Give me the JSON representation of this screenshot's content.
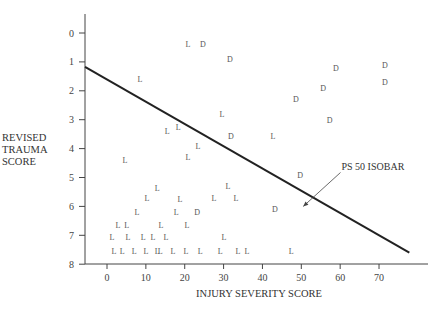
{
  "chart_data": {
    "type": "scatter",
    "title": "",
    "xlabel": "INJURY SEVERITY SCORE",
    "ylabel_lines": [
      "REVISED",
      "TRAUMA",
      "SCORE"
    ],
    "xlim": [
      -6,
      78
    ],
    "ylim": [
      -0.8,
      8
    ],
    "y_inverted": true,
    "grid": false,
    "x_ticks": [
      0,
      10,
      20,
      30,
      40,
      50,
      60,
      70
    ],
    "y_ticks": [
      0,
      1,
      2,
      3,
      4,
      5,
      6,
      7,
      8
    ],
    "legend": {
      "L": "Lived",
      "D": "Died"
    },
    "series": [
      {
        "name": "L",
        "marker_text": "L",
        "points": [
          [
            20.8,
            0.38
          ],
          [
            8.5,
            1.6
          ],
          [
            29.6,
            2.8
          ],
          [
            18.3,
            3.25
          ],
          [
            15.5,
            3.4
          ],
          [
            42.7,
            3.55
          ],
          [
            23.4,
            3.9
          ],
          [
            20.8,
            4.3
          ],
          [
            4.6,
            4.4
          ],
          [
            31.1,
            5.3
          ],
          [
            12.9,
            5.36
          ],
          [
            33.2,
            5.7
          ],
          [
            27.5,
            5.7
          ],
          [
            10.3,
            5.7
          ],
          [
            18.8,
            5.75
          ],
          [
            7.7,
            6.2
          ],
          [
            17.8,
            6.2
          ],
          [
            2.8,
            6.64
          ],
          [
            5.1,
            6.64
          ],
          [
            13.9,
            6.64
          ],
          [
            20.6,
            6.64
          ],
          [
            1.3,
            7.05
          ],
          [
            5.4,
            7.05
          ],
          [
            9.3,
            7.05
          ],
          [
            11.8,
            7.05
          ],
          [
            15.2,
            7.05
          ],
          [
            30.1,
            7.05
          ],
          [
            1.8,
            7.55
          ],
          [
            3.9,
            7.55
          ],
          [
            7.0,
            7.55
          ],
          [
            10.0,
            7.55
          ],
          [
            12.9,
            7.55
          ],
          [
            13.7,
            7.55
          ],
          [
            17.0,
            7.55
          ],
          [
            20.3,
            7.55
          ],
          [
            24.0,
            7.55
          ],
          [
            29.1,
            7.55
          ],
          [
            33.7,
            7.55
          ],
          [
            36.0,
            7.55
          ],
          [
            47.4,
            7.55
          ]
        ]
      },
      {
        "name": "D",
        "marker_text": "D",
        "points": [
          [
            24.7,
            0.38
          ],
          [
            31.6,
            0.9
          ],
          [
            58.9,
            1.2
          ],
          [
            71.5,
            1.1
          ],
          [
            55.6,
            1.9
          ],
          [
            71.5,
            1.7
          ],
          [
            48.6,
            2.3
          ],
          [
            57.3,
            3.0
          ],
          [
            31.9,
            3.55
          ],
          [
            49.7,
            4.9
          ],
          [
            43.2,
            6.1
          ],
          [
            23.2,
            6.2
          ]
        ]
      }
    ],
    "isobar": {
      "label": "PS 50 ISOBAR",
      "start": [
        -5.7,
        1.17
      ],
      "end": [
        77.8,
        7.6
      ],
      "label_position": [
        57,
        5.0
      ],
      "arrow_to": [
        50.5,
        6.0
      ]
    }
  }
}
